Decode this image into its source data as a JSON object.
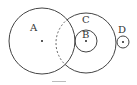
{
  "diagram": {
    "type": "circle-relations",
    "circles": [
      {
        "id": "A",
        "label": "A",
        "cx": 42,
        "cy": 41,
        "r": 33
      },
      {
        "id": "C",
        "label": "C",
        "cx": 86,
        "cy": 43,
        "r": 30
      },
      {
        "id": "B",
        "label": "B",
        "cx": 86,
        "cy": 41,
        "r": 11
      },
      {
        "id": "D",
        "label": "D",
        "cx": 123,
        "cy": 42,
        "r": 6
      }
    ],
    "colors": {
      "stroke": "#444444",
      "background": "#ffffff"
    }
  }
}
